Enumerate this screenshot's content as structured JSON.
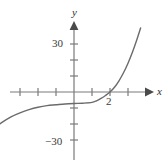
{
  "chart_data": {
    "type": "line",
    "title": "",
    "xlabel": "x",
    "ylabel": "y",
    "xlim": [
      -6,
      4.5
    ],
    "ylim": [
      -45,
      42
    ],
    "grid": false,
    "legend": null,
    "axis_labels": {
      "x": "x",
      "y": "y"
    },
    "y_tick_labels": [
      {
        "value": 30,
        "text": "30"
      },
      {
        "value": -30,
        "text": "−30"
      }
    ],
    "x_tick_labels": [
      {
        "value": 2,
        "text": "2"
      }
    ],
    "y_ticks_unlabeled": [
      10,
      20,
      -10,
      -20
    ],
    "x_ticks_unlabeled": [
      -6,
      -4,
      -2,
      1,
      3
    ],
    "x_intercept": 2,
    "annotations": [
      {
        "text": "2",
        "x": 2,
        "y": 0,
        "note": "x-intercept label below axis"
      }
    ],
    "series": [
      {
        "name": "curve",
        "color": "#6b6b6b",
        "description": "cubic-shaped increasing curve with flat inflection near x = 0, crossing the x-axis at x = 2",
        "points": [
          {
            "x": -6.0,
            "y": -43.0
          },
          {
            "x": -5.5,
            "y": -36.0
          },
          {
            "x": -5.0,
            "y": -29.0
          },
          {
            "x": -4.5,
            "y": -23.5
          },
          {
            "x": -4.0,
            "y": -19.0
          },
          {
            "x": -3.5,
            "y": -15.5
          },
          {
            "x": -3.0,
            "y": -13.0
          },
          {
            "x": -2.5,
            "y": -11.0
          },
          {
            "x": -2.0,
            "y": -9.5
          },
          {
            "x": -1.5,
            "y": -8.5
          },
          {
            "x": -1.0,
            "y": -8.0
          },
          {
            "x": -0.5,
            "y": -7.5
          },
          {
            "x": 0.0,
            "y": -7.2
          },
          {
            "x": 0.5,
            "y": -7.0
          },
          {
            "x": 1.0,
            "y": -6.5
          },
          {
            "x": 1.25,
            "y": -5.5
          },
          {
            "x": 1.5,
            "y": -4.0
          },
          {
            "x": 1.75,
            "y": -2.2
          },
          {
            "x": 2.0,
            "y": 0.0
          },
          {
            "x": 2.25,
            "y": 3.0
          },
          {
            "x": 2.5,
            "y": 7.0
          },
          {
            "x": 2.75,
            "y": 12.0
          },
          {
            "x": 3.0,
            "y": 18.0
          },
          {
            "x": 3.25,
            "y": 25.0
          },
          {
            "x": 3.5,
            "y": 33.0
          },
          {
            "x": 3.7,
            "y": 40.0
          }
        ]
      }
    ]
  },
  "figure": {
    "background_color": "#ffffff",
    "axis_color": "#7a7a7a",
    "curve_color": "#6b6b6b",
    "text_color": "#3a3a3a"
  }
}
